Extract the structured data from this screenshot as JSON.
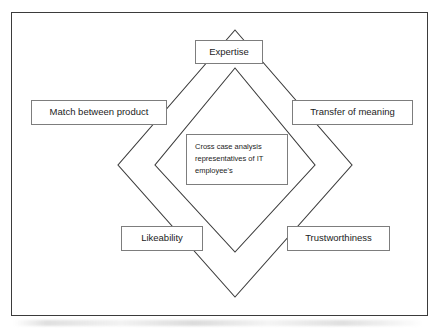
{
  "figure": {
    "frame": {
      "border_color": "#3b3b3b"
    },
    "diamond_stroke": "#3b3b3b",
    "box_border": "#7d7d7d",
    "center": {
      "lines": [
        "Cross case analysis",
        "representatives of IT",
        "employee's"
      ]
    },
    "nodes": [
      {
        "key": "expertise",
        "label": "Expertise"
      },
      {
        "key": "match",
        "label": "Match between product"
      },
      {
        "key": "transfer",
        "label": "Transfer of meaning"
      },
      {
        "key": "likeability",
        "label": "Likeability"
      },
      {
        "key": "trustworthiness",
        "label": "Trustworthiness"
      }
    ]
  },
  "diagram_data": {
    "type": "diagram",
    "shape": "nested-diamonds",
    "outer_diamond": {
      "top": [
        235,
        30
      ],
      "right": [
        352,
        165
      ],
      "bottom": [
        235,
        297
      ],
      "left": [
        118,
        165
      ]
    },
    "inner_diamond": {
      "top": [
        235,
        68
      ],
      "right": [
        315,
        165
      ],
      "bottom": [
        235,
        252
      ],
      "left": [
        155,
        165
      ]
    },
    "center_label": "Cross case analysis representatives of IT employee's",
    "vertex_labels": [
      "Expertise",
      "Transfer of meaning",
      "Trustworthiness",
      "Likeability",
      "Match between product"
    ]
  }
}
